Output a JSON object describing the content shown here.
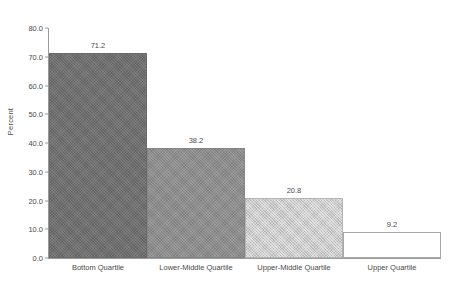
{
  "chart_data": {
    "type": "bar",
    "title": "",
    "subtitle": "",
    "xlabel": "",
    "ylabel": "Percent",
    "ylim": [
      0,
      80
    ],
    "ytick_step": 10,
    "ytick_labels": [
      "0.0",
      "10.0",
      "20.0",
      "30.0",
      "40.0",
      "50.0",
      "60.0",
      "70.0",
      "80.0"
    ],
    "ytick_values": [
      0,
      10,
      20,
      30,
      40,
      50,
      60,
      70,
      80
    ],
    "grid": false,
    "legend": false,
    "legend_position": "none",
    "data_labels": true,
    "bar_gap": 0,
    "categories": [
      "Bottom Quartile",
      "Lower-Middle Quartile",
      "Upper-Middle Quartile",
      "Upper Quartile"
    ],
    "values": [
      71.2,
      38.2,
      20.8,
      9.2
    ],
    "value_labels": [
      "71.2",
      "38.2",
      "20.8",
      "9.2"
    ],
    "bar_fills": [
      "#6f6f6f",
      "#8d8d8d",
      "#cccccc",
      "#ffffff"
    ],
    "bar_fill_styles": [
      "darkest",
      "dark",
      "light",
      "none"
    ],
    "bar_border_color": "#9a9a9a",
    "axis_color": "#9a9a9a",
    "text_color": "#4a4a4a",
    "background": "#ffffff"
  }
}
